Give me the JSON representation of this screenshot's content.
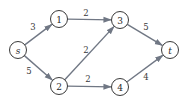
{
  "diagram": {
    "type": "directed-flow-network",
    "colors": {
      "edge": "#707784",
      "node_stroke": "#3a3a3a",
      "node_fill": "#ffffff",
      "text": "#2a2a2a"
    },
    "nodes": [
      {
        "id": "s",
        "label": "s",
        "italic": true,
        "x": 18,
        "y": 50
      },
      {
        "id": "1",
        "label": "1",
        "italic": false,
        "x": 59,
        "y": 19
      },
      {
        "id": "2",
        "label": "2",
        "italic": false,
        "x": 59,
        "y": 86
      },
      {
        "id": "3",
        "label": "3",
        "italic": false,
        "x": 120,
        "y": 20
      },
      {
        "id": "4",
        "label": "4",
        "italic": false,
        "x": 120,
        "y": 87
      },
      {
        "id": "t",
        "label": "t",
        "italic": true,
        "x": 170,
        "y": 50
      }
    ],
    "edges": [
      {
        "from": "s",
        "to": "1",
        "weight": "3",
        "label_x": 33,
        "label_y": 27
      },
      {
        "from": "s",
        "to": "2",
        "weight": "5",
        "label_x": 29,
        "label_y": 71
      },
      {
        "from": "1",
        "to": "3",
        "weight": "2",
        "label_x": 86,
        "label_y": 13
      },
      {
        "from": "2",
        "to": "3",
        "weight": "2",
        "label_x": 86,
        "label_y": 50
      },
      {
        "from": "2",
        "to": "4",
        "weight": "2",
        "label_x": 88,
        "label_y": 79
      },
      {
        "from": "3",
        "to": "t",
        "weight": "5",
        "label_x": 146,
        "label_y": 27
      },
      {
        "from": "4",
        "to": "t",
        "weight": "4",
        "label_x": 146,
        "label_y": 77
      }
    ]
  }
}
